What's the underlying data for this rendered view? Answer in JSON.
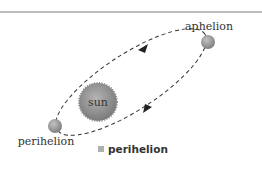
{
  "diagram": {
    "center_label": "sun",
    "points": [
      {
        "name": "aphelion",
        "label": "aphelion"
      },
      {
        "name": "perihelion",
        "label": "perihelion"
      }
    ],
    "orbit_style": "dashed ellipse with direction arrows",
    "colors": {
      "sun": "#8a8a8a",
      "planet": "#9a9a9a",
      "orbit": "#333333",
      "caption_swatch": "#b0b0b0"
    }
  },
  "caption": {
    "text": "perihelion"
  }
}
